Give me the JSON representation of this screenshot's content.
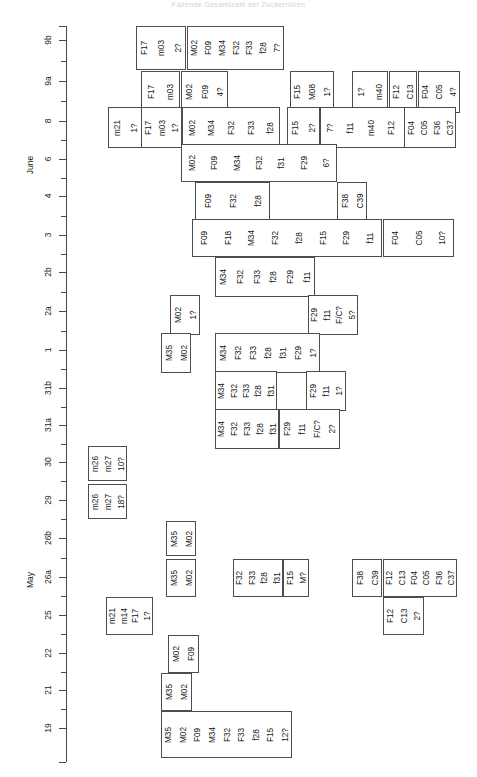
{
  "title": "Fallende Gesamtzahl der Zuckerrüben",
  "axis": {
    "name": "date-axis",
    "orientation": "vertical",
    "months": [
      {
        "label": "June",
        "y": 165
      },
      {
        "label": "May",
        "y": 580
      }
    ],
    "ticks": [
      {
        "label": "9b",
        "y": 40
      },
      {
        "label": "9a",
        "y": 81
      },
      {
        "label": "8",
        "y": 121
      },
      {
        "label": "6",
        "y": 159
      },
      {
        "label": "4",
        "y": 196
      },
      {
        "label": "3",
        "y": 235
      },
      {
        "label": "2b",
        "y": 272
      },
      {
        "label": "2a",
        "y": 311
      },
      {
        "label": "1",
        "y": 350
      },
      {
        "label": "31b",
        "y": 388
      },
      {
        "label": "31a",
        "y": 425
      },
      {
        "label": "30",
        "y": 462
      },
      {
        "label": "29",
        "y": 500
      },
      {
        "label": "26b",
        "y": 538
      },
      {
        "label": "26a",
        "y": 577
      },
      {
        "label": "25",
        "y": 615
      },
      {
        "label": "22",
        "y": 653
      },
      {
        "label": "21",
        "y": 690
      },
      {
        "label": "19",
        "y": 728
      }
    ]
  },
  "chart_data": {
    "type": "table",
    "title": "Fallende Gesamtzahl der Zuckerrüben",
    "xlabel": "",
    "ylabel": "Date",
    "categories": [
      "9b",
      "9a",
      "8",
      "6",
      "4",
      "3",
      "2b",
      "2a",
      "1",
      "31b",
      "31a",
      "30",
      "29",
      "26b",
      "26a",
      "25",
      "22",
      "21",
      "19"
    ],
    "legend": [],
    "grid": false,
    "rows": [
      {
        "row": "9b",
        "y": 26,
        "h": 44,
        "boxes": [
          {
            "x": 136,
            "w": 50,
            "labels": [
              "F17",
              "m03",
              "2?"
            ]
          },
          {
            "x": 187,
            "w": 97,
            "labels": [
              "M02",
              "F09",
              "M34",
              "F32",
              "F33",
              "f28",
              "7?"
            ]
          }
        ]
      },
      {
        "row": "9a",
        "y": 71,
        "h": 42,
        "boxes": [
          {
            "x": 141,
            "w": 39,
            "labels": [
              "F17",
              "m03"
            ]
          },
          {
            "x": 181,
            "w": 47,
            "labels": [
              "M02",
              "F09",
              "4?"
            ]
          },
          {
            "x": 290,
            "w": 44,
            "labels": [
              "F15",
              "M08",
              "1?"
            ]
          },
          {
            "x": 352,
            "w": 36,
            "labels": [
              "1?",
              "m40"
            ]
          },
          {
            "x": 389,
            "w": 28,
            "labels": [
              "F12",
              "C13"
            ]
          },
          {
            "x": 418,
            "w": 42,
            "labels": [
              "F04",
              "C05",
              "4?"
            ]
          }
        ]
      },
      {
        "row": "8",
        "y": 107,
        "h": 41,
        "boxes": [
          {
            "x": 108,
            "w": 34,
            "labels": [
              "m21",
              "1?"
            ]
          },
          {
            "x": 141,
            "w": 41,
            "labels": [
              "F17",
              "m03",
              "1?"
            ]
          },
          {
            "x": 182,
            "w": 98,
            "labels": [
              "M02",
              "M34",
              "F32",
              "F33",
              "f28"
            ]
          },
          {
            "x": 287,
            "w": 33,
            "labels": [
              "F15",
              "2?"
            ]
          },
          {
            "x": 320,
            "w": 101,
            "labels": [
              "7?",
              "f11",
              "m40",
              "F12",
              "C13"
            ]
          },
          {
            "x": 404,
            "w": 52,
            "labels": [
              "F04",
              "C05",
              "F36",
              "C37"
            ]
          }
        ]
      },
      {
        "row": "6",
        "y": 144,
        "h": 38,
        "boxes": [
          {
            "x": 181,
            "w": 156,
            "labels": [
              "M02",
              "F09",
              "M34",
              "F32",
              "f31",
              "F29",
              "6?"
            ]
          }
        ]
      },
      {
        "row": "4",
        "y": 182,
        "h": 38,
        "boxes": [
          {
            "x": 195,
            "w": 75,
            "labels": [
              "F09",
              "F32",
              "f28"
            ]
          },
          {
            "x": 337,
            "w": 30,
            "labels": [
              "F38",
              "C39"
            ]
          }
        ]
      },
      {
        "row": "3",
        "y": 219,
        "h": 38,
        "boxes": [
          {
            "x": 192,
            "w": 190,
            "labels": [
              "F09",
              "F18",
              "M34",
              "F32",
              "f28",
              "F15",
              "F29",
              "f11"
            ]
          },
          {
            "x": 383,
            "w": 71,
            "labels": [
              "F04",
              "C05",
              "10?"
            ]
          }
        ]
      },
      {
        "row": "2b",
        "y": 257,
        "h": 40,
        "boxes": [
          {
            "x": 215,
            "w": 100,
            "labels": [
              "M34",
              "F32",
              "F33",
              "f28",
              "F29",
              "f11"
            ]
          }
        ]
      },
      {
        "row": "2a",
        "y": 295,
        "h": 40,
        "boxes": [
          {
            "x": 170,
            "w": 30,
            "labels": [
              "M02",
              "1?"
            ]
          },
          {
            "x": 308,
            "w": 50,
            "labels": [
              "F29",
              "f11",
              "F/C?",
              "5?"
            ]
          }
        ]
      },
      {
        "row": "1",
        "y": 333,
        "h": 40,
        "boxes": [
          {
            "x": 161,
            "w": 30,
            "labels": [
              "M35",
              "M02"
            ]
          },
          {
            "x": 215,
            "w": 105,
            "labels": [
              "M34",
              "F32",
              "F33",
              "f28",
              "f31",
              "F29",
              "1?"
            ]
          }
        ]
      },
      {
        "row": "31b",
        "y": 371,
        "h": 40,
        "boxes": [
          {
            "x": 215,
            "w": 62,
            "labels": [
              "M34",
              "F32",
              "F33",
              "f28",
              "f31"
            ]
          },
          {
            "x": 306,
            "w": 40,
            "labels": [
              "F29",
              "f11",
              "1?"
            ]
          }
        ]
      },
      {
        "row": "31a",
        "y": 409,
        "h": 40,
        "boxes": [
          {
            "x": 215,
            "w": 64,
            "labels": [
              "M34",
              "F32",
              "F33",
              "f28",
              "f31"
            ]
          },
          {
            "x": 279,
            "w": 61,
            "labels": [
              "F29",
              "f11",
              "F/C?",
              "2?"
            ]
          }
        ]
      },
      {
        "row": "30",
        "y": 446,
        "h": 35,
        "boxes": [
          {
            "x": 88,
            "w": 39,
            "labels": [
              "m26",
              "m27",
              "10?"
            ]
          }
        ]
      },
      {
        "row": "29",
        "y": 484,
        "h": 35,
        "boxes": [
          {
            "x": 88,
            "w": 39,
            "labels": [
              "m26",
              "m27",
              "18?"
            ]
          }
        ]
      },
      {
        "row": "26b",
        "y": 521,
        "h": 35,
        "boxes": [
          {
            "x": 166,
            "w": 30,
            "labels": [
              "M35",
              "M02"
            ]
          }
        ]
      },
      {
        "row": "26a",
        "y": 559,
        "h": 38,
        "boxes": [
          {
            "x": 166,
            "w": 30,
            "labels": [
              "M35",
              "M02"
            ]
          },
          {
            "x": 233,
            "w": 50,
            "labels": [
              "F32",
              "F33",
              "f28",
              "f31"
            ]
          },
          {
            "x": 283,
            "w": 26,
            "labels": [
              "F15",
              "M?"
            ]
          },
          {
            "x": 352,
            "w": 30,
            "labels": [
              "F38",
              "C39"
            ]
          },
          {
            "x": 383,
            "w": 74,
            "labels": [
              "F12",
              "C13",
              "F04",
              "C05",
              "F36",
              "C37"
            ]
          }
        ]
      },
      {
        "row": "25",
        "y": 597,
        "h": 38,
        "boxes": [
          {
            "x": 106,
            "w": 47,
            "labels": [
              "m21",
              "m14",
              "F17",
              "1?"
            ]
          },
          {
            "x": 383,
            "w": 41,
            "labels": [
              "F12",
              "C13",
              "2?"
            ]
          }
        ]
      },
      {
        "row": "22",
        "y": 635,
        "h": 38,
        "boxes": [
          {
            "x": 168,
            "w": 31,
            "labels": [
              "M02",
              "F09"
            ]
          }
        ]
      },
      {
        "row": "21",
        "y": 673,
        "h": 38,
        "boxes": [
          {
            "x": 161,
            "w": 31,
            "labels": [
              "M35",
              "M02"
            ]
          }
        ]
      },
      {
        "row": "19",
        "y": 711,
        "h": 47,
        "boxes": [
          {
            "x": 161,
            "w": 131,
            "labels": [
              "M35",
              "M02",
              "F09",
              "M34",
              "F32",
              "F33",
              "f28",
              "F15",
              "12?"
            ]
          }
        ]
      }
    ]
  }
}
